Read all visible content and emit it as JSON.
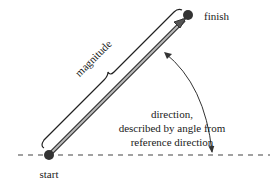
{
  "diagram": {
    "labels": {
      "start": "start",
      "finish": "finish",
      "magnitude": "magnitude",
      "direction_line1": "direction,",
      "direction_line2": "described by angle from",
      "direction_line3": "reference direction"
    },
    "colors": {
      "vector": "#7a7a7a",
      "vector_outline": "#333333",
      "dot": "#333333",
      "reference_line": "#444444",
      "text": "#1a1a1a"
    },
    "elements": {
      "start_point": {
        "x": 49,
        "y": 155
      },
      "finish_point": {
        "x": 188,
        "y": 15
      },
      "reference_line": {
        "style": "dashed",
        "y": 155
      }
    }
  }
}
